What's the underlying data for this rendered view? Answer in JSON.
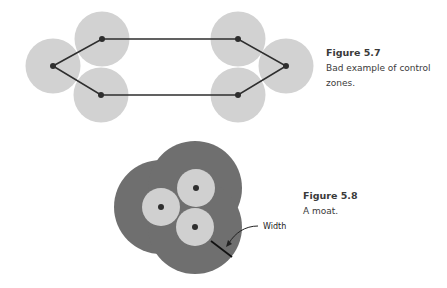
{
  "figures": [
    {
      "id": "5.7",
      "title": "Figure 5.7",
      "caption_lines": [
        "Bad example of control",
        "zones."
      ],
      "zone_color": "#d2d2d2",
      "node_color": "#2e2e2e",
      "line_color": "#2e2e2e",
      "node_count": 6,
      "description": "Six control zones linked in a ring, with long unprotected gaps between left and right clusters"
    },
    {
      "id": "5.8",
      "title": "Figure 5.8",
      "caption_lines": [
        "A moat."
      ],
      "annotation": "Width",
      "moat_color": "#6f6f6f",
      "zone_color": "#d0d0d0",
      "node_color": "#2e2e2e",
      "node_count": 3
    }
  ]
}
